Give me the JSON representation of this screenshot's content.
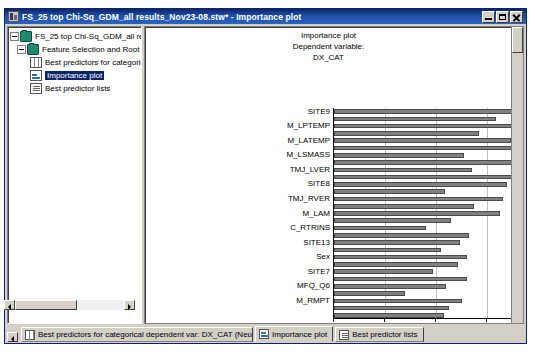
{
  "window": {
    "title": "FS_25 top Chi-Sq_GDM_all results_Nov23-08.stw* - Importance plot",
    "icon": "workbook-icon",
    "buttons": {
      "minimize": "_",
      "maximize": "▭",
      "close": "✕"
    }
  },
  "tree": {
    "items": [
      {
        "label": "FS_25 top Chi-Sq_GDM_all results_Nc",
        "icon": "folder-icon",
        "level": 0,
        "expander": "minus",
        "selected": false
      },
      {
        "label": "Feature Selection and Root Caus",
        "icon": "folder-icon",
        "level": 1,
        "expander": "minus",
        "selected": false
      },
      {
        "label": "Best predictors for categoric",
        "icon": "spreadsheet-icon",
        "level": 2,
        "expander": "none",
        "selected": false
      },
      {
        "label": "Importance plot",
        "icon": "plot-icon",
        "level": 2,
        "expander": "none",
        "selected": true
      },
      {
        "label": "Best predictor lists",
        "icon": "list-icon",
        "level": 2,
        "expander": "none",
        "selected": false
      }
    ]
  },
  "chart_data": {
    "type": "bar",
    "orientation": "horizontal",
    "title": "Importance plot",
    "subtitle": "Dependent variable:",
    "subtitle2": "DX_CAT",
    "xlabel": "Importance (Chi-square)",
    "ylabel": "",
    "xlim": [
      0,
      60
    ],
    "xticks": [
      0,
      10,
      20,
      30,
      40,
      50,
      60
    ],
    "grid": true,
    "legend": "none",
    "note": "Y labels are drawn on alternating bars; unlabeled bars are between labeled ones.",
    "categories": [
      "SITE9",
      "",
      "M_LPTEMP",
      "",
      "M_LATEMP",
      "",
      "M_LSMASS",
      "",
      "TMJ_LVER",
      "",
      "SITE8",
      "",
      "TMJ_RVER",
      "",
      "M_LAM",
      "",
      "C_RTRINS",
      "",
      "SITE13",
      "",
      "Sex",
      "",
      "SITE7",
      "",
      "MFQ_Q6",
      "",
      "M_RMPT",
      "",
      ""
    ],
    "values": [
      56.0,
      31.8,
      40.2,
      28.5,
      34.8,
      45.5,
      25.5,
      45.2,
      27.0,
      35.5,
      34.0,
      21.8,
      33.2,
      27.5,
      32.5,
      23.0,
      18.0,
      26.5,
      24.8,
      21.0,
      26.0,
      24.3,
      19.5,
      26.0,
      22.0,
      14.0,
      25.0,
      22.5,
      21.5
    ],
    "bar_color": "#808080",
    "bar_edge_color": "#4a4a4a"
  },
  "tabs": [
    {
      "label": "Best predictors for categorical dependent var: DX_CAT (Neural...",
      "icon": "spreadsheet-icon",
      "active": false
    },
    {
      "label": "Importance plot",
      "icon": "plot-icon",
      "active": true
    },
    {
      "label": "Best predictor lists",
      "icon": "list-icon",
      "active": false
    }
  ]
}
